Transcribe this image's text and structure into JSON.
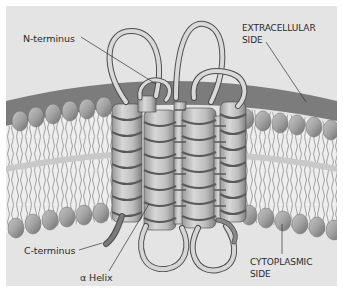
{
  "figure": {
    "colors": {
      "background": "#e4e4e4",
      "frame": "#ffffff",
      "head_group": "#a7a7a7",
      "head_group_shadow": "#7d7d7d",
      "tail": "#f1f1f1",
      "tail_stroke": "#8c8c8c",
      "outer_surface": "#7a7a7a",
      "ribbon_light": "#d6d6d6",
      "ribbon_dark": "#6a6a6a",
      "label_text": "#2a2a2a",
      "leader_line": "#333333"
    },
    "labels": {
      "n_terminus": "N-terminus",
      "extracellular_line1": "EXTRACELLULAR",
      "extracellular_line2": "SIDE",
      "c_terminus": "C-terminus",
      "alpha_helix": "α Helix",
      "cytoplasmic_line1": "CYTOPLASMIC",
      "cytoplasmic_line2": "SIDE"
    },
    "helix_count": 7
  }
}
